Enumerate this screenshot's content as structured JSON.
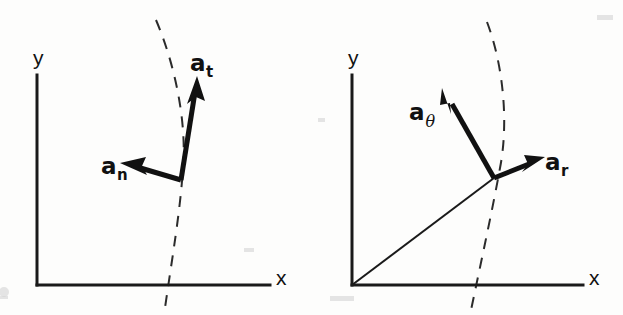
{
  "figure": {
    "kind": "physics-vector-diagram",
    "background_color": "#fdfdfc",
    "ink_color": "#111111",
    "width": 623,
    "height": 315
  },
  "panels": [
    {
      "id": "normal-tangential",
      "axes": {
        "y_label": "y",
        "x_label": "x",
        "origin": [
          37,
          285
        ],
        "y_top": [
          37,
          75
        ],
        "x_right": [
          270,
          285
        ]
      },
      "trajectory": {
        "style": "dashed",
        "description": "curved path through the particle point"
      },
      "particle_point": [
        181,
        180
      ],
      "vectors": [
        {
          "name": "a_t",
          "label_base": "a",
          "label_sub": "t",
          "sub_style": "upright",
          "tip": [
            197,
            80
          ],
          "tail": [
            181,
            180
          ],
          "label_pos": [
            193,
            62
          ]
        },
        {
          "name": "a_n",
          "label_base": "a",
          "label_sub": "n",
          "sub_style": "upright",
          "tip": [
            124,
            165
          ],
          "tail": [
            181,
            180
          ],
          "label_pos": [
            104,
            163
          ]
        }
      ]
    },
    {
      "id": "polar",
      "axes": {
        "y_label": "y",
        "x_label": "x",
        "origin": [
          352,
          285
        ],
        "y_top": [
          352,
          75
        ],
        "x_right": [
          583,
          285
        ]
      },
      "trajectory": {
        "style": "dashed",
        "description": "curved path through the particle point"
      },
      "radial_line": {
        "from": [
          352,
          285
        ],
        "to": [
          494,
          178
        ]
      },
      "particle_point": [
        494,
        178
      ],
      "vectors": [
        {
          "name": "a_theta",
          "label_base": "a",
          "label_sub": "θ",
          "sub_style": "italic",
          "tip": [
            443,
            88
          ],
          "tail": [
            494,
            178
          ],
          "label_pos": [
            413,
            108
          ]
        },
        {
          "name": "a_r",
          "label_base": "a",
          "label_sub": "r",
          "sub_style": "upright",
          "tip": [
            542,
            158
          ],
          "tail": [
            494,
            178
          ],
          "label_pos": [
            546,
            158
          ]
        }
      ]
    }
  ]
}
